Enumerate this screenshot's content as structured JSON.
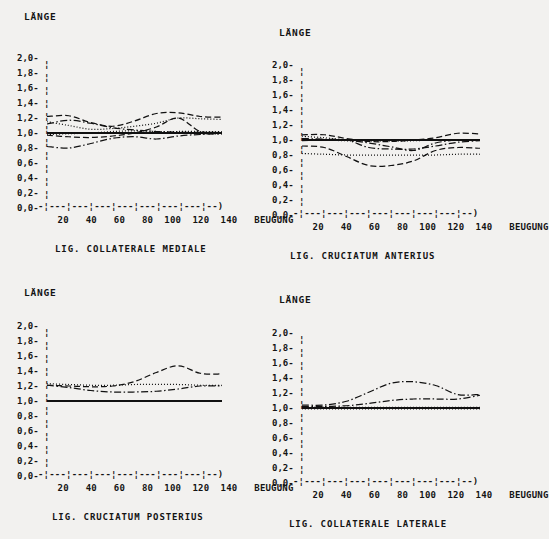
{
  "figure": {
    "background_color": "#f2f1ef",
    "ink_color": "#111111",
    "panel_count": 4
  },
  "axis_common": {
    "y_axis_title": "LÄNGE",
    "x_axis_title": "BEUGUNG",
    "y_tick_labels": [
      "2,0",
      "1,8",
      "1,6",
      "1,4",
      "1,2",
      "1,0",
      "0,8",
      "0,6",
      "0,4",
      "0,2",
      "0,0"
    ],
    "x_tick_labels": [
      "20",
      "40",
      "60",
      "80",
      "100",
      "120",
      "140"
    ],
    "x_axis_art": "-¦---¦---¦---¦---¦---¦---¦---¦--)",
    "y_axis_art": "¦",
    "y_tick_mark": "-",
    "ylim": [
      0.0,
      2.0
    ],
    "xlim": [
      0,
      160
    ]
  },
  "panels": [
    {
      "id": "lig-collaterale-mediale",
      "caption": "LIG. COLLATERALE MEDIALE",
      "position": "top-left"
    },
    {
      "id": "lig-cruciatum-anterius",
      "caption": "LIG. CRUCIATUM ANTERIUS",
      "position": "top-right"
    },
    {
      "id": "lig-cruciatum-posterius",
      "caption": "LIG. CRUCIATUM POSTERIUS",
      "position": "bottom-left"
    },
    {
      "id": "lig-collaterale-laterale",
      "caption": "LIG. COLLATERALE LATERALE",
      "position": "bottom-right"
    }
  ],
  "chart_data": [
    {
      "type": "line",
      "id": "lig-collaterale-mediale",
      "title": "LIG. COLLATERALE MEDIALE",
      "xlabel": "BEUGUNG",
      "ylabel": "LÄNGE",
      "xlim": [
        0,
        160
      ],
      "ylim": [
        0.0,
        2.0
      ],
      "grid": false,
      "legend": "none",
      "x": [
        0,
        20,
        40,
        60,
        80,
        100,
        120,
        140,
        160
      ],
      "series": [
        {
          "name": "curve-1",
          "dash": "solid",
          "values": [
            1.0,
            1.0,
            1.0,
            1.0,
            1.0,
            1.0,
            1.0,
            1.0,
            1.0
          ]
        },
        {
          "name": "curve-2",
          "dash": "dotted",
          "values": [
            1.0,
            1.0,
            1.0,
            1.0,
            1.0,
            1.01,
            1.02,
            1.02,
            1.02
          ]
        },
        {
          "name": "curve-3",
          "dash": "dashed",
          "values": [
            1.22,
            1.23,
            1.14,
            1.09,
            1.16,
            1.26,
            1.27,
            1.22,
            1.21
          ]
        },
        {
          "name": "curve-4",
          "dash": "dashdot",
          "values": [
            1.12,
            1.17,
            1.13,
            1.07,
            1.04,
            1.02,
            1.01,
            1.01,
            1.01
          ]
        },
        {
          "name": "curve-5",
          "dash": "dotted",
          "values": [
            1.15,
            1.1,
            1.05,
            1.06,
            1.09,
            1.13,
            1.2,
            1.19,
            1.18
          ]
        },
        {
          "name": "curve-6",
          "dash": "dashdot",
          "values": [
            0.82,
            0.8,
            0.86,
            0.93,
            0.95,
            0.92,
            0.96,
            0.98,
            0.99
          ]
        },
        {
          "name": "curve-7",
          "dash": "dashed",
          "values": [
            0.97,
            0.95,
            0.94,
            0.96,
            1.0,
            1.08,
            1.2,
            1.02,
            1.0
          ]
        },
        {
          "name": "curve-8",
          "dash": "dotted",
          "values": [
            0.98,
            0.99,
            1.0,
            1.02,
            1.03,
            1.02,
            1.0,
            0.99,
            0.99
          ]
        }
      ]
    },
    {
      "type": "line",
      "id": "lig-cruciatum-anterius",
      "title": "LIG. CRUCIATUM ANTERIUS",
      "xlabel": "BEUGUNG",
      "ylabel": "LÄNGE",
      "xlim": [
        0,
        160
      ],
      "ylim": [
        0.0,
        2.0
      ],
      "grid": false,
      "legend": "none",
      "x": [
        0,
        20,
        40,
        60,
        80,
        100,
        120,
        140,
        160
      ],
      "series": [
        {
          "name": "curve-1",
          "dash": "solid",
          "values": [
            1.0,
            1.0,
            1.0,
            1.0,
            1.0,
            1.0,
            1.0,
            1.0,
            1.0
          ]
        },
        {
          "name": "curve-2",
          "dash": "dotted",
          "values": [
            1.05,
            1.03,
            1.0,
            1.0,
            1.0,
            1.0,
            1.0,
            1.0,
            1.0
          ]
        },
        {
          "name": "curve-3",
          "dash": "dashed",
          "values": [
            1.07,
            1.07,
            1.02,
            0.98,
            0.98,
            1.0,
            1.03,
            1.09,
            1.08
          ]
        },
        {
          "name": "curve-4",
          "dash": "dashdot",
          "values": [
            0.99,
            1.0,
            1.0,
            0.9,
            0.88,
            0.88,
            0.92,
            0.97,
            0.99
          ]
        },
        {
          "name": "curve-5",
          "dash": "dashed",
          "values": [
            0.92,
            0.9,
            0.78,
            0.66,
            0.66,
            0.72,
            0.86,
            0.9,
            0.89
          ]
        },
        {
          "name": "curve-6",
          "dash": "dotted",
          "values": [
            0.82,
            0.81,
            0.8,
            0.8,
            0.8,
            0.8,
            0.8,
            0.81,
            0.81
          ]
        },
        {
          "name": "curve-7",
          "dash": "dashdot",
          "values": [
            1.02,
            1.01,
            1.0,
            0.96,
            0.91,
            0.86,
            0.96,
            1.0,
            1.0
          ]
        },
        {
          "name": "curve-8",
          "dash": "dotted",
          "values": [
            1.0,
            1.0,
            0.99,
            0.99,
            0.99,
            0.99,
            1.0,
            1.0,
            1.0
          ]
        }
      ]
    },
    {
      "type": "line",
      "id": "lig-cruciatum-posterius",
      "title": "LIG. CRUCIATUM POSTERIUS",
      "xlabel": "BEUGUNG",
      "ylabel": "LÄNGE",
      "xlim": [
        0,
        160
      ],
      "ylim": [
        0.0,
        2.0
      ],
      "grid": false,
      "legend": "none",
      "x": [
        0,
        20,
        40,
        60,
        80,
        100,
        120,
        140,
        160
      ],
      "series": [
        {
          "name": "curve-1",
          "dash": "solid",
          "values": [
            1.0,
            1.0,
            1.0,
            1.0,
            1.0,
            1.0,
            1.0,
            1.0,
            1.0
          ]
        },
        {
          "name": "curve-2",
          "dash": "dotted",
          "values": [
            1.23,
            1.22,
            1.21,
            1.21,
            1.22,
            1.22,
            1.22,
            1.21,
            1.21
          ]
        },
        {
          "name": "curve-3",
          "dash": "dashed",
          "values": [
            1.21,
            1.2,
            1.19,
            1.2,
            1.26,
            1.38,
            1.47,
            1.37,
            1.36
          ]
        },
        {
          "name": "curve-4",
          "dash": "dashdot",
          "values": [
            1.21,
            1.18,
            1.14,
            1.12,
            1.12,
            1.13,
            1.16,
            1.2,
            1.2
          ]
        }
      ]
    },
    {
      "type": "line",
      "id": "lig-collaterale-laterale",
      "title": "LIG. COLLATERALE LATERALE",
      "xlabel": "BEUGUNG",
      "ylabel": "LÄNGE",
      "xlim": [
        0,
        160
      ],
      "ylim": [
        0.0,
        2.0
      ],
      "grid": false,
      "legend": "none",
      "x": [
        0,
        20,
        40,
        60,
        80,
        100,
        120,
        140,
        160
      ],
      "series": [
        {
          "name": "curve-1",
          "dash": "solid",
          "values": [
            1.0,
            1.0,
            1.0,
            1.0,
            1.0,
            1.0,
            1.0,
            1.0,
            1.0
          ]
        },
        {
          "name": "curve-2",
          "dash": "dotted",
          "values": [
            0.99,
            0.99,
            0.99,
            0.99,
            0.99,
            0.99,
            0.99,
            0.99,
            0.99
          ]
        },
        {
          "name": "curve-3",
          "dash": "dashdot",
          "values": [
            1.04,
            1.04,
            1.09,
            1.21,
            1.33,
            1.35,
            1.3,
            1.18,
            1.18
          ]
        },
        {
          "name": "curve-4",
          "dash": "dashdot",
          "values": [
            1.02,
            1.02,
            1.03,
            1.06,
            1.1,
            1.12,
            1.12,
            1.12,
            1.17
          ]
        },
        {
          "name": "curve-5",
          "dash": "dotted",
          "values": [
            1.01,
            1.01,
            1.01,
            1.01,
            1.01,
            1.01,
            1.01,
            1.01,
            1.01
          ]
        }
      ]
    }
  ]
}
